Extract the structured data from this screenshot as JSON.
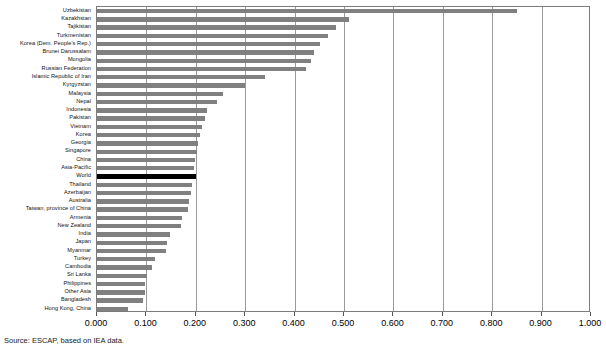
{
  "source_note": "Source: ESCAP, based on IEA data.",
  "axis": {
    "ticks": [
      "0.000",
      "0.100",
      "0.200",
      "0.300",
      "0.400",
      "0.500",
      "0.600",
      "0.700",
      "0.800",
      "0.900",
      "1.000"
    ]
  },
  "chart_data": {
    "type": "bar",
    "orientation": "horizontal",
    "title": "",
    "subtitle": "",
    "xlabel": "",
    "ylabel": "",
    "xlim": [
      0.0,
      1.0
    ],
    "grid": true,
    "legend": null,
    "highlight_category": "World",
    "colors": {
      "bar": "#808080",
      "highlight_bar": "#000000",
      "gridline": "#9a9a9a",
      "axis": "#7b7b7b",
      "text": "#000000"
    },
    "categories": [
      "Uzbekistan",
      "Kazakhstan",
      "Tajikistan",
      "Turkmenistan",
      "Korea (Dem. People's Rep.)",
      "Brunei Darussalam",
      "Mongolia",
      "Russian Federation",
      "Islamic Republic of Iran",
      "Kyrgyzstan",
      "Malaysia",
      "Nepal",
      "Indonesia",
      "Pakistan",
      "Vietnam",
      "Korea",
      "Georgia",
      "Singapore",
      "China",
      "Asia-Pacific",
      "World",
      "Thailand",
      "Azerbaijan",
      "Australia",
      "Taiwan, province of China",
      "Armenia",
      "New Zealand",
      "India",
      "Japan",
      "Myanmar",
      "Turkey",
      "Cambodia",
      "Sri Lanka",
      "Philippines",
      "Other Asia",
      "Bangladesh",
      "Hong Kong, China"
    ],
    "values": [
      0.85,
      0.511,
      0.483,
      0.468,
      0.452,
      0.44,
      0.434,
      0.424,
      0.34,
      0.3,
      0.255,
      0.243,
      0.222,
      0.218,
      0.212,
      0.208,
      0.204,
      0.202,
      0.198,
      0.197,
      0.2,
      0.192,
      0.19,
      0.186,
      0.185,
      0.172,
      0.17,
      0.148,
      0.142,
      0.14,
      0.118,
      0.112,
      0.102,
      0.098,
      0.097,
      0.094,
      0.062
    ]
  }
}
